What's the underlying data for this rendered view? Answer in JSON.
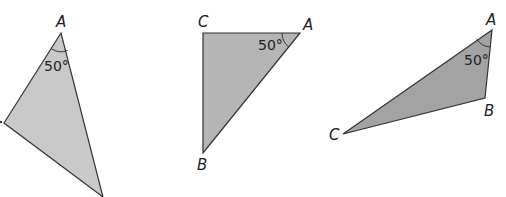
{
  "figure": {
    "triangles": [
      {
        "id": "triangle-1",
        "fill": "#c9c9c9",
        "vertices": {
          "A": "A",
          "B": "",
          "C": "C"
        },
        "angle_label": "50°"
      },
      {
        "id": "triangle-2",
        "fill": "#b5b5b5",
        "vertices": {
          "A": "A",
          "B": "B",
          "C": "C"
        },
        "angle_label": "50°"
      },
      {
        "id": "triangle-3",
        "fill": "#a3a3a3",
        "vertices": {
          "A": "A",
          "B": "B",
          "C": "C"
        },
        "angle_label": "50°"
      }
    ]
  }
}
